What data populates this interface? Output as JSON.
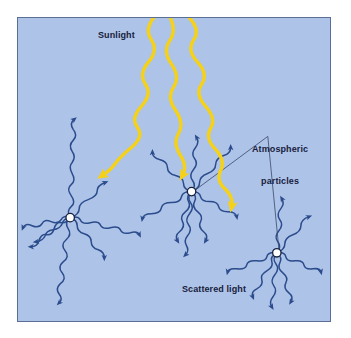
{
  "figure": {
    "background_color": "#ffffff",
    "panel_color": "#aec3e8",
    "panel_border_color": "#5b6f96"
  },
  "labels": {
    "sunlight": "Sunlight",
    "atmospheric_particles_line1": "Atmospheric",
    "atmospheric_particles_line2": "particles",
    "scattered_light": "Scattered light"
  },
  "colors": {
    "sunbeam": "#f5d218",
    "scattered_ray": "#2b4c8c",
    "particle_fill": "#ffffff",
    "particle_stroke": "#17213d",
    "leader_line": "#3a4a6b",
    "label_text": "#17213d"
  },
  "diagram_data": {
    "type": "diagram",
    "subject": "Rayleigh scattering of sunlight by atmospheric particles",
    "incoming_beams": 3,
    "particles": [
      {
        "id": "particle-left",
        "x": 69,
        "y": 216,
        "rays": 8
      },
      {
        "id": "particle-center",
        "x": 190,
        "y": 190,
        "rays": 8
      },
      {
        "id": "particle-right",
        "x": 275,
        "y": 251,
        "rays": 7
      }
    ],
    "beam_targets": [
      "particle-left",
      "particle-center",
      "particle-right"
    ],
    "leader_lines": [
      {
        "from": "atmospheric-particles-label",
        "to": "particle-center"
      },
      {
        "from": "atmospheric-particles-label",
        "to": "particle-right"
      }
    ]
  }
}
